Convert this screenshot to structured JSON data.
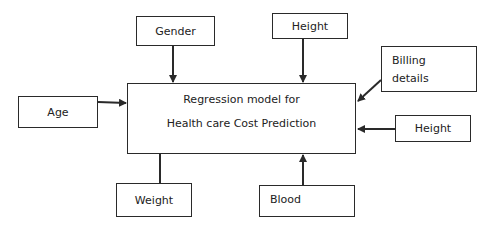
{
  "diagram": {
    "central": {
      "line1": "Regression model for",
      "line2": "Health care Cost Prediction"
    },
    "inputs": {
      "gender": "Gender",
      "height_top": "Height",
      "billing_line1": "Billing",
      "billing_line2": "details",
      "age": "Age",
      "height_right": "Height",
      "weight": "Weight",
      "blood": "Blood"
    },
    "colors": {
      "stroke": "#2a2a2a",
      "background": "#ffffff",
      "text": "#222222"
    }
  }
}
